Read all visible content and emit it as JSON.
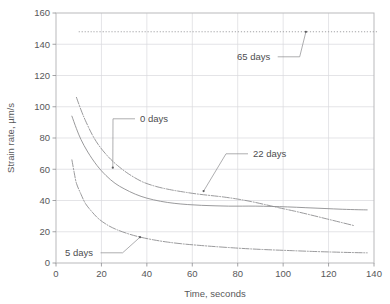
{
  "chart_data": {
    "type": "line",
    "title": "",
    "xlabel": "Time, seconds",
    "ylabel": "Strain rate, µm/s",
    "xlim": [
      0,
      140
    ],
    "ylim": [
      0,
      160
    ],
    "xticks": [
      0,
      20,
      40,
      60,
      80,
      100,
      120,
      140
    ],
    "yticks": [
      0,
      20,
      40,
      60,
      80,
      100,
      120,
      140,
      160
    ],
    "grid": true,
    "legend_position": "inline-annotations",
    "series": [
      {
        "name": "0 days",
        "style": "solid",
        "x": [
          7,
          9,
          11,
          14,
          18,
          22,
          26,
          30,
          35,
          40,
          46,
          52,
          58,
          64,
          70,
          76,
          82,
          88,
          95,
          102,
          110,
          118,
          126,
          133,
          137
        ],
        "y": [
          94,
          86,
          79,
          71,
          62.5,
          56,
          51,
          47.5,
          44,
          41.5,
          39.5,
          38.2,
          37.4,
          36.9,
          36.6,
          36.4,
          36.4,
          36.4,
          36.2,
          35.9,
          35.4,
          34.9,
          34.4,
          34.1,
          34.0
        ]
      },
      {
        "name": "22 days",
        "style": "dashdot",
        "x": [
          9,
          11,
          13,
          16,
          19,
          23,
          27,
          32,
          38,
          44,
          50,
          56,
          62,
          68,
          74,
          80,
          86,
          92,
          98,
          105,
          112,
          119,
          126,
          131
        ],
        "y": [
          106,
          98,
          91,
          82,
          75,
          68,
          62.5,
          57,
          52,
          49,
          47,
          45.5,
          44.2,
          43.2,
          42.2,
          40.9,
          39.3,
          37.4,
          35.4,
          33.2,
          30.8,
          28.3,
          25.8,
          24.0
        ]
      },
      {
        "name": "5 days",
        "style": "dashdot",
        "x": [
          7,
          8,
          9,
          11,
          13,
          16,
          19,
          23,
          27,
          32,
          37,
          43,
          49,
          56,
          63,
          70,
          78,
          86,
          95,
          104,
          113,
          122,
          130,
          137
        ],
        "y": [
          66,
          58,
          51,
          44,
          38,
          32.5,
          28,
          24,
          21.2,
          18.6,
          16.6,
          14.8,
          13.4,
          12.2,
          11.3,
          10.5,
          9.7,
          9.0,
          8.4,
          7.9,
          7.4,
          7.0,
          6.7,
          6.5
        ]
      },
      {
        "name": "65 days",
        "style": "dotted",
        "x": [
          10,
          142
        ],
        "y": [
          148,
          148
        ]
      }
    ],
    "annotations": [
      {
        "label": "0 days",
        "text_x": 140,
        "text_y": 122,
        "point_x": 25,
        "point_y": 61
      },
      {
        "label": "22 days",
        "text_x": 253,
        "text_y": 157,
        "point_x": 65,
        "point_y": 46
      },
      {
        "label": "5 days",
        "text_x": 65,
        "text_y": 256,
        "point_x": 37,
        "point_y": 16.5
      },
      {
        "label": "65 days",
        "text_x": 237,
        "text_y": 60,
        "point_x": 110,
        "point_y": 148
      }
    ]
  },
  "axes": {
    "x_tick_labels": [
      "0",
      "20",
      "40",
      "60",
      "80",
      "100",
      "120",
      "140"
    ],
    "y_tick_labels": [
      "0",
      "20",
      "40",
      "60",
      "80",
      "100",
      "120",
      "140",
      "160"
    ],
    "x_axis_title": "Time, seconds",
    "y_axis_title": "Strain rate, µm/s"
  },
  "colors": {
    "background": "#ffffff",
    "frame": "#b9b9bb",
    "grid": "#d9d9dc",
    "curve": "#8e8e91",
    "text": "#58585a"
  }
}
